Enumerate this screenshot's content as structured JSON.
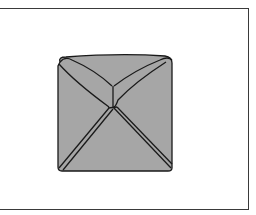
{
  "figure": {
    "colors": {
      "background": "#ffffff",
      "fill": "#a6a6a6",
      "stroke": "#1a1a1a",
      "frame": "#3a3a3a"
    },
    "labels": []
  }
}
